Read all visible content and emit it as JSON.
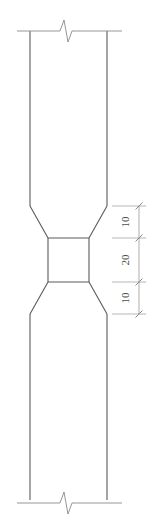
{
  "drawing": {
    "title": "Column Neck Elevation Detail",
    "background_color": "#ffffff",
    "line_color": "#6b6b6b",
    "text_color": "#4a4a4a",
    "width": 162,
    "height": 526
  },
  "member": {
    "name": "column-body",
    "left_edge_x": 30,
    "right_edge_x": 107,
    "top_y": 31,
    "bottom_y": 500,
    "upper_chamfer_start_y": 206,
    "upper_chamfer_end_y": 238,
    "lower_chamfer_start_y": 282,
    "lower_chamfer_end_y": 314,
    "neck_left_x": 48,
    "neck_right_x": 89,
    "neck_top_y": 238,
    "neck_bottom_y": 282
  },
  "break_lines": {
    "top": {
      "name": "top-break-line",
      "y": 31,
      "x_start": 17,
      "x_end": 122
    },
    "bottom": {
      "name": "bottom-break-line",
      "y": 500,
      "x_start": 17,
      "x_end": 122
    }
  },
  "dimensions": {
    "chain_name": "vertical-dimension-chain",
    "orientation": "vertical",
    "text_rotation_deg": -90,
    "unit_note": "",
    "line_x": 139,
    "entries": [
      {
        "label": "10",
        "value": 10,
        "from_y": 206,
        "to_y": 238,
        "name": "dimension-upper-chamfer"
      },
      {
        "label": "20",
        "value": 20,
        "from_y": 238,
        "to_y": 282,
        "name": "dimension-neck"
      },
      {
        "label": "10",
        "value": 10,
        "from_y": 282,
        "to_y": 314,
        "name": "dimension-lower-chamfer"
      }
    ],
    "tick_y_positions": [
      206,
      238,
      282,
      314
    ],
    "extension_line_x_start": 110,
    "extension_line_x_end": 146
  }
}
